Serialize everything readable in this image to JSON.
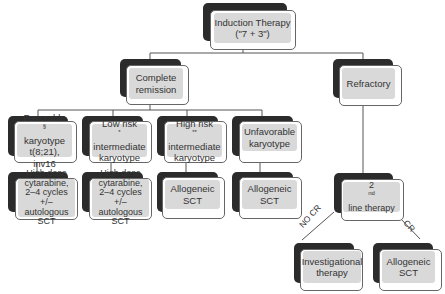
{
  "diagram": {
    "nodes": {
      "induction": {
        "lines": [
          "Induction Therapy",
          "(\"7 + 3\")"
        ]
      },
      "complete_remission": {
        "lines": [
          "Complete",
          "remission"
        ]
      },
      "refractory": {
        "lines": [
          "Refractory"
        ]
      },
      "favorable": {
        "line1": "Favorable",
        "line1_sup": "§",
        "line2": "karyotype",
        "line3": "t(8;21), inv16"
      },
      "low_risk": {
        "line1": "Low risk",
        "line1_sup": "*",
        "line2": "intermediate",
        "line3": "karyotype"
      },
      "high_risk": {
        "line1": "High risk",
        "line1_sup": "**",
        "line2": "intermediate",
        "line3": "karyotype"
      },
      "unfavorable": {
        "lines": [
          "Unfavorable",
          "karyotype"
        ]
      },
      "hd_cytarabine_1": {
        "lines": [
          "High dose",
          "cytarabine,",
          "2–4 cycles +/–",
          "autologous SCT"
        ]
      },
      "hd_cytarabine_2": {
        "lines": [
          "High dose",
          "cytarabine,",
          "2–4 cycles +/–",
          "autologous SCT"
        ]
      },
      "allogeneic_1": {
        "lines": [
          "Allogeneic",
          "SCT"
        ]
      },
      "allogeneic_2": {
        "lines": [
          "Allogeneic",
          "SCT"
        ]
      },
      "second_line": {
        "prefix": "2",
        "sup": "nd",
        "suffix": " line therapy"
      },
      "investigational": {
        "lines": [
          "Investigational",
          "therapy"
        ]
      },
      "allogeneic_3": {
        "lines": [
          "Allogeneic",
          "SCT"
        ]
      }
    },
    "edge_labels": {
      "no_cr": "NO CR",
      "cr": "CR"
    },
    "colors": {
      "shadow": "#2b2b2b",
      "inner_fill": "#d9d9d9",
      "line": "#555555",
      "card_border": "#666666"
    }
  }
}
